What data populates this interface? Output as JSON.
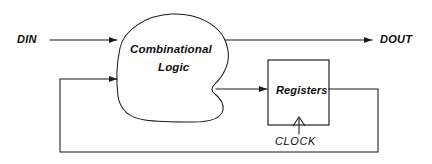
{
  "diagram": {
    "ports": {
      "input_label": "DIN",
      "output_label": "DOUT",
      "clock_label": "CLOCK"
    },
    "blocks": [
      {
        "id": "combinational-logic",
        "shape": "cloud",
        "line1": "Combinational",
        "line2": "Logic"
      },
      {
        "id": "registers",
        "shape": "rectangle",
        "label": "Registers"
      }
    ],
    "connections": [
      {
        "id": "din-to-logic",
        "from": "DIN",
        "to": "Combinational Logic",
        "arrow": "true"
      },
      {
        "id": "logic-to-dout",
        "from": "Combinational Logic",
        "to": "DOUT",
        "arrow": "true"
      },
      {
        "id": "logic-to-registers",
        "from": "Combinational Logic",
        "to": "Registers",
        "arrow": "true"
      },
      {
        "id": "clock-to-registers",
        "from": "CLOCK",
        "to": "Registers",
        "arrow": "true"
      },
      {
        "id": "registers-feedback",
        "from": "Registers",
        "to": "Combinational Logic",
        "arrow": "true"
      }
    ],
    "colors": {
      "stroke": "#1a1a1a",
      "fill": "#ffffff",
      "text": "#0d0d0d"
    }
  }
}
